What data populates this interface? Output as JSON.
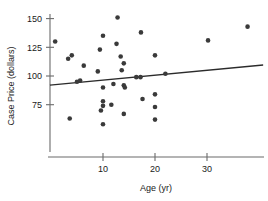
{
  "chart_data": {
    "type": "scatter",
    "title": "",
    "xlabel": "Age (yr)",
    "ylabel": "Case Price (dollars)",
    "xlim": [
      -0.6,
      41.0
    ],
    "ylim": [
      55.0,
      156.0
    ],
    "xticks": [
      10,
      20,
      30
    ],
    "xtick_labels": [
      "10",
      "20",
      "30"
    ],
    "yticks": [
      75,
      100,
      125,
      150
    ],
    "ytick_labels": [
      "75",
      "100",
      "125",
      "150"
    ],
    "grid": false,
    "legend": null,
    "points": [
      {
        "x": 0.8,
        "y": 130
      },
      {
        "x": 3.3,
        "y": 115
      },
      {
        "x": 4.0,
        "y": 118
      },
      {
        "x": 3.6,
        "y": 63
      },
      {
        "x": 5.0,
        "y": 95
      },
      {
        "x": 5.6,
        "y": 96
      },
      {
        "x": 6.3,
        "y": 109
      },
      {
        "x": 9.0,
        "y": 104
      },
      {
        "x": 9.4,
        "y": 123
      },
      {
        "x": 9.6,
        "y": 70
      },
      {
        "x": 10.0,
        "y": 135
      },
      {
        "x": 10.0,
        "y": 90
      },
      {
        "x": 10.0,
        "y": 78
      },
      {
        "x": 10.0,
        "y": 74
      },
      {
        "x": 10.0,
        "y": 58
      },
      {
        "x": 11.6,
        "y": 75
      },
      {
        "x": 12.0,
        "y": 93
      },
      {
        "x": 12.6,
        "y": 128
      },
      {
        "x": 12.8,
        "y": 151
      },
      {
        "x": 13.4,
        "y": 117
      },
      {
        "x": 13.6,
        "y": 105
      },
      {
        "x": 14.0,
        "y": 111
      },
      {
        "x": 14.0,
        "y": 92
      },
      {
        "x": 14.2,
        "y": 90
      },
      {
        "x": 14.0,
        "y": 67
      },
      {
        "x": 16.4,
        "y": 99
      },
      {
        "x": 17.2,
        "y": 99
      },
      {
        "x": 17.3,
        "y": 138
      },
      {
        "x": 17.6,
        "y": 80
      },
      {
        "x": 20.0,
        "y": 118
      },
      {
        "x": 20.0,
        "y": 84
      },
      {
        "x": 20.0,
        "y": 73
      },
      {
        "x": 20.0,
        "y": 62
      },
      {
        "x": 22.0,
        "y": 102
      },
      {
        "x": 30.2,
        "y": 131
      },
      {
        "x": 37.8,
        "y": 143
      }
    ],
    "trendline": {
      "x0": -0.2,
      "y0": 92.0,
      "x1": 40.8,
      "y1": 109.6
    }
  }
}
